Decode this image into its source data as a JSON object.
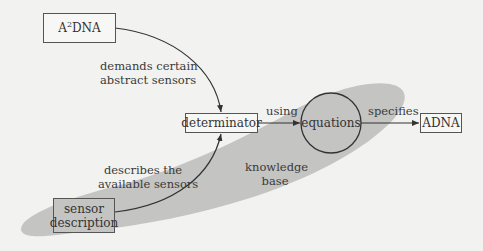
{
  "diagram": {
    "nodes": {
      "a2dna": {
        "label_base": "A",
        "label_sup": "2",
        "label_rest": "DNA"
      },
      "determinator": {
        "label": "determinator"
      },
      "equations": {
        "label": "equations"
      },
      "adna": {
        "label": "ADNA"
      },
      "sensor_description": {
        "line1": "sensor",
        "line2": "description"
      }
    },
    "edges": {
      "demands": {
        "line1": "demands certain",
        "line2": "abstract sensors"
      },
      "describes": {
        "line1": "describes the",
        "line2": "available sensors"
      },
      "using": {
        "label": "using"
      },
      "specifies": {
        "label": "specifies"
      }
    },
    "region": {
      "line1": "knowledge",
      "line2": "base"
    },
    "colors": {
      "background": "#f2f2f0",
      "region_fill": "#c4c4c2",
      "stroke": "#333333"
    }
  }
}
